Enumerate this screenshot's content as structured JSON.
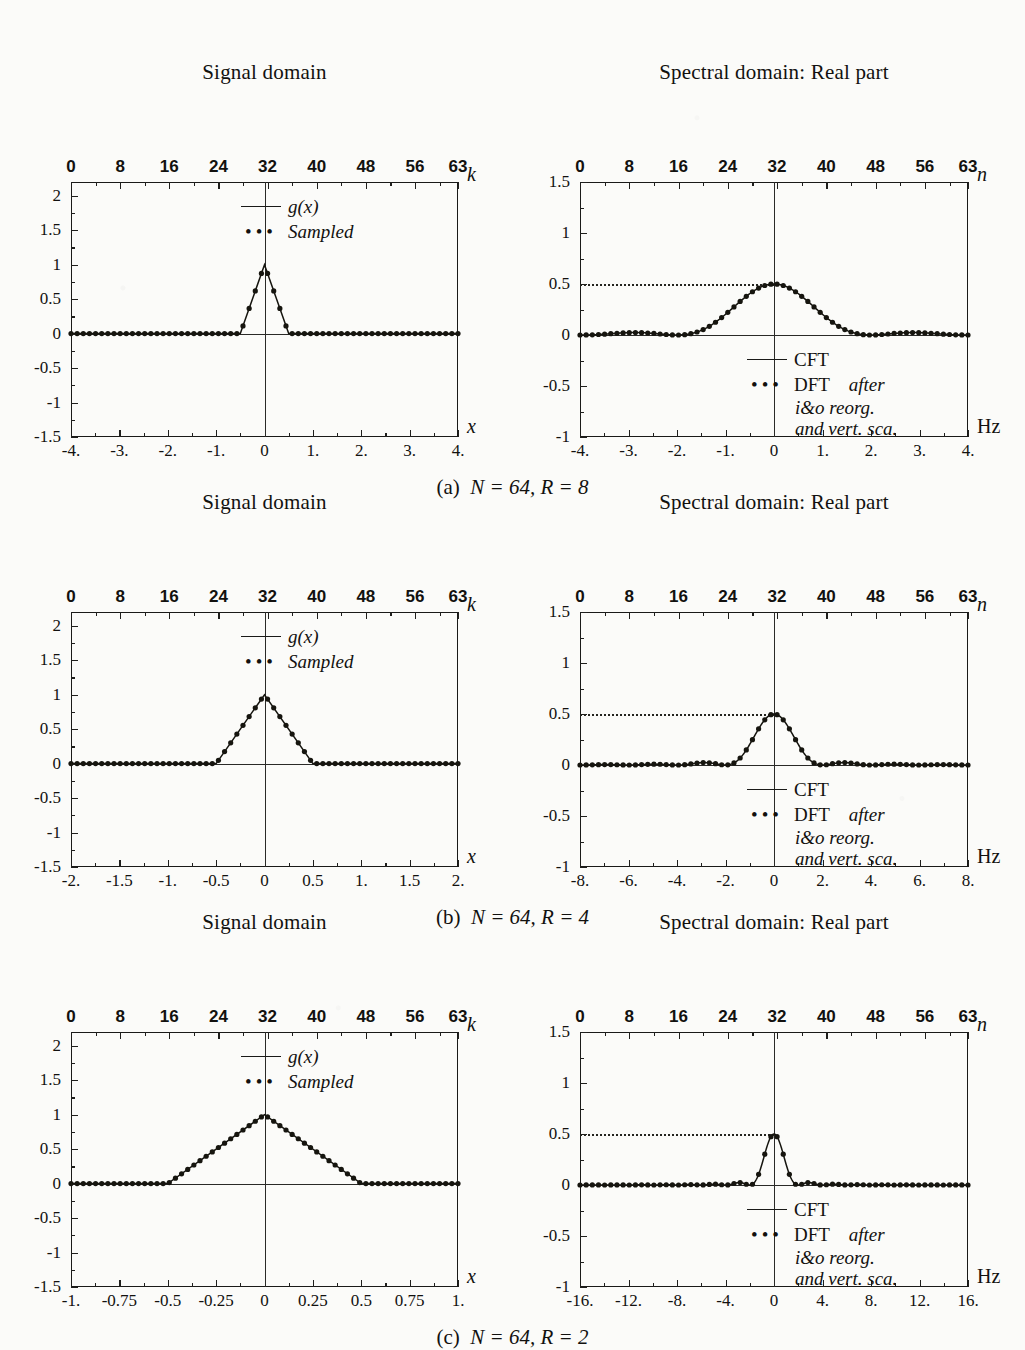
{
  "figure": {
    "rows": [
      {
        "id": "a",
        "caption_label": "(a)",
        "caption_text": "N = 64,  R = 8",
        "left": {
          "title": "Signal domain",
          "top_axis_name": "k",
          "bottom_axis_name": "x",
          "top_ticks": [
            "0",
            "8",
            "16",
            "24",
            "32",
            "40",
            "48",
            "56",
            "63"
          ],
          "bottom_ticks": [
            "-4.",
            "-3.",
            "-2.",
            "-1.",
            "0",
            "1.",
            "2.",
            "3.",
            "4."
          ],
          "y_ticks": [
            "2",
            "1.5",
            "1",
            "0.5",
            "0",
            "-0.5",
            "-1",
            "-1.5"
          ],
          "legend": [
            {
              "marker": "line",
              "text": "g(x)",
              "italic": true
            },
            {
              "marker": "dots",
              "text": "Sampled",
              "italic": true
            }
          ]
        },
        "right": {
          "title": "Spectral domain: Real part",
          "top_axis_name": "n",
          "bottom_axis_name": "Hz",
          "top_ticks": [
            "0",
            "8",
            "16",
            "24",
            "32",
            "40",
            "48",
            "56",
            "63"
          ],
          "bottom_ticks": [
            "-4.",
            "-3.",
            "-2.",
            "-1.",
            "0",
            "1.",
            "2.",
            "3.",
            "4."
          ],
          "y_ticks": [
            "1.5",
            "1",
            "0.5",
            "0",
            "-0.5",
            "-1"
          ],
          "legend": [
            {
              "marker": "line",
              "text": "CFT",
              "italic": false
            },
            {
              "marker": "dots",
              "text": "DFT",
              "italic": false,
              "suffix": "after",
              "sublines": [
                "i&o reorg.",
                "and vert. sca."
              ]
            }
          ]
        }
      },
      {
        "id": "b",
        "caption_label": "(b)",
        "caption_text": "N = 64,  R = 4",
        "left": {
          "title": "Signal domain",
          "top_axis_name": "k",
          "bottom_axis_name": "x",
          "top_ticks": [
            "0",
            "8",
            "16",
            "24",
            "32",
            "40",
            "48",
            "56",
            "63"
          ],
          "bottom_ticks": [
            "-2.",
            "-1.5",
            "-1.",
            "-0.5",
            "0",
            "0.5",
            "1.",
            "1.5",
            "2."
          ],
          "y_ticks": [
            "2",
            "1.5",
            "1",
            "0.5",
            "0",
            "-0.5",
            "-1",
            "-1.5"
          ],
          "legend": [
            {
              "marker": "line",
              "text": "g(x)",
              "italic": true
            },
            {
              "marker": "dots",
              "text": "Sampled",
              "italic": true
            }
          ]
        },
        "right": {
          "title": "Spectral domain: Real part",
          "top_axis_name": "n",
          "bottom_axis_name": "Hz",
          "top_ticks": [
            "0",
            "8",
            "16",
            "24",
            "32",
            "40",
            "48",
            "56",
            "63"
          ],
          "bottom_ticks": [
            "-8.",
            "-6.",
            "-4.",
            "-2.",
            "0",
            "2.",
            "4.",
            "6.",
            "8."
          ],
          "y_ticks": [
            "1.5",
            "1",
            "0.5",
            "0",
            "-0.5",
            "-1"
          ],
          "legend": [
            {
              "marker": "line",
              "text": "CFT",
              "italic": false
            },
            {
              "marker": "dots",
              "text": "DFT",
              "italic": false,
              "suffix": "after",
              "sublines": [
                "i&o reorg.",
                "and vert. sca."
              ]
            }
          ]
        }
      },
      {
        "id": "c",
        "caption_label": "(c)",
        "caption_text": "N = 64,  R = 2",
        "left": {
          "title": "Signal domain",
          "top_axis_name": "k",
          "bottom_axis_name": "x",
          "top_ticks": [
            "0",
            "8",
            "16",
            "24",
            "32",
            "40",
            "48",
            "56",
            "63"
          ],
          "bottom_ticks": [
            "-1.",
            "-0.75",
            "-0.5",
            "-0.25",
            "0",
            "0.25",
            "0.5",
            "0.75",
            "1."
          ],
          "y_ticks": [
            "2",
            "1.5",
            "1",
            "0.5",
            "0",
            "-0.5",
            "-1",
            "-1.5"
          ],
          "legend": [
            {
              "marker": "line",
              "text": "g(x)",
              "italic": true
            },
            {
              "marker": "dots",
              "text": "Sampled",
              "italic": true
            }
          ]
        },
        "right": {
          "title": "Spectral domain: Real part",
          "top_axis_name": "n",
          "bottom_axis_name": "Hz",
          "top_ticks": [
            "0",
            "8",
            "16",
            "24",
            "32",
            "40",
            "48",
            "56",
            "63"
          ],
          "bottom_ticks": [
            "-16.",
            "-12.",
            "-8.",
            "-4.",
            "0",
            "4.",
            "8.",
            "12.",
            "16."
          ],
          "y_ticks": [
            "1.5",
            "1",
            "0.5",
            "0",
            "-0.5",
            "-1"
          ],
          "legend": [
            {
              "marker": "line",
              "text": "CFT",
              "italic": false
            },
            {
              "marker": "dots",
              "text": "DFT",
              "italic": false,
              "suffix": "after",
              "sublines": [
                "i&o reorg.",
                "and vert. sca."
              ]
            }
          ]
        }
      }
    ]
  },
  "chart_data": [
    {
      "id": "a-signal",
      "type": "line",
      "title": "Signal domain",
      "xlabel": "x",
      "xlabel_top": "k",
      "ylabel": "",
      "xlim": [
        -4,
        4
      ],
      "ylim": [
        -1.5,
        2.2
      ],
      "xlim_k": [
        0,
        63
      ],
      "grid": false,
      "legend": [
        "g(x)",
        "Sampled"
      ],
      "series": [
        {
          "name": "g(x)",
          "kind": "triangle",
          "half_width_x": 0.5,
          "peak": 1.0,
          "center_x": 0.0
        },
        {
          "name": "Sampled",
          "kind": "samples",
          "n": 64,
          "sample_spacing_x": 0.125,
          "note": "triangle sampled at 64 points from x=-4 to x=4, nonzero only for |x|<0.5"
        }
      ]
    },
    {
      "id": "a-spectral",
      "type": "line",
      "title": "Spectral domain: Real part",
      "xlabel": "Hz",
      "xlabel_top": "n",
      "xlim": [
        -4,
        4
      ],
      "ylim": [
        -1,
        1.5
      ],
      "xlim_n": [
        0,
        63
      ],
      "reference_line_y": 0.5,
      "grid": false,
      "legend": [
        "CFT",
        "DFT after i&o reorg. and vert. sca."
      ],
      "series": [
        {
          "name": "CFT",
          "kind": "sinc2",
          "peak": 0.5,
          "first_null_hz": 2.0,
          "center_hz": 0.0
        },
        {
          "name": "DFT",
          "kind": "samples",
          "n": 64,
          "peak": 0.5,
          "first_null_hz": 2.0
        }
      ]
    },
    {
      "id": "b-signal",
      "type": "line",
      "title": "Signal domain",
      "xlabel": "x",
      "xlabel_top": "k",
      "xlim": [
        -2,
        2
      ],
      "ylim": [
        -1.5,
        2.2
      ],
      "xlim_k": [
        0,
        63
      ],
      "grid": false,
      "legend": [
        "g(x)",
        "Sampled"
      ],
      "series": [
        {
          "name": "g(x)",
          "kind": "triangle",
          "half_width_x": 0.5,
          "peak": 1.0,
          "center_x": 0.0
        },
        {
          "name": "Sampled",
          "kind": "samples",
          "n": 64,
          "sample_spacing_x": 0.0625
        }
      ]
    },
    {
      "id": "b-spectral",
      "type": "line",
      "title": "Spectral domain: Real part",
      "xlabel": "Hz",
      "xlabel_top": "n",
      "xlim": [
        -8,
        8
      ],
      "ylim": [
        -1,
        1.5
      ],
      "xlim_n": [
        0,
        63
      ],
      "reference_line_y": 0.5,
      "grid": false,
      "legend": [
        "CFT",
        "DFT after i&o reorg. and vert. sca."
      ],
      "series": [
        {
          "name": "CFT",
          "kind": "sinc2",
          "peak": 0.5,
          "first_null_hz": 2.0,
          "center_hz": 0.0
        },
        {
          "name": "DFT",
          "kind": "samples",
          "n": 64,
          "peak": 0.5,
          "first_null_hz": 2.0
        }
      ]
    },
    {
      "id": "c-signal",
      "type": "line",
      "title": "Signal domain",
      "xlabel": "x",
      "xlabel_top": "k",
      "xlim": [
        -1,
        1
      ],
      "ylim": [
        -1.5,
        2.2
      ],
      "xlim_k": [
        0,
        63
      ],
      "grid": false,
      "legend": [
        "g(x)",
        "Sampled"
      ],
      "series": [
        {
          "name": "g(x)",
          "kind": "triangle",
          "half_width_x": 0.5,
          "peak": 1.0,
          "center_x": 0.0
        },
        {
          "name": "Sampled",
          "kind": "samples",
          "n": 64,
          "sample_spacing_x": 0.03125
        }
      ]
    },
    {
      "id": "c-spectral",
      "type": "line",
      "title": "Spectral domain: Real part",
      "xlabel": "Hz",
      "xlabel_top": "n",
      "xlim": [
        -16,
        16
      ],
      "ylim": [
        -1,
        1.5
      ],
      "xlim_n": [
        0,
        63
      ],
      "reference_line_y": 0.5,
      "grid": false,
      "legend": [
        "CFT",
        "DFT after i&o reorg. and vert. sca."
      ],
      "series": [
        {
          "name": "CFT",
          "kind": "sinc2",
          "peak": 0.5,
          "first_null_hz": 2.0,
          "center_hz": 0.0
        },
        {
          "name": "DFT",
          "kind": "samples",
          "n": 64,
          "peak": 0.5,
          "first_null_hz": 2.0
        }
      ]
    }
  ],
  "colors": {
    "ink": "#12110f",
    "paper": "#fbfbf9",
    "frame": "#1a1a18"
  }
}
